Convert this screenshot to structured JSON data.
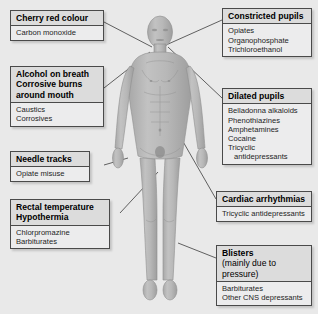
{
  "diagram": {
    "background_color": "#e9e9e9",
    "figure_label": "human-body-anterior-view"
  },
  "boxes": [
    {
      "id": "cherry-red-colour",
      "header": "Cherry red colour",
      "subheader": "",
      "items": [
        "Carbon monoxide"
      ],
      "side": "left"
    },
    {
      "id": "alcohol-on-breath",
      "header": "Alcohol on breath\nCorrosive burns\naround mouth",
      "subheader": "",
      "items": [
        "Caustics",
        "Corrosives"
      ],
      "side": "left"
    },
    {
      "id": "needle-tracks",
      "header": "Needle tracks",
      "subheader": "",
      "items": [
        "Opiate misuse"
      ],
      "side": "left"
    },
    {
      "id": "rectal-temperature",
      "header": "Rectal temperature\nHypothermia",
      "subheader": "",
      "items": [
        "Chlorpromazine",
        "Barbiturates"
      ],
      "side": "left"
    },
    {
      "id": "constricted-pupils",
      "header": "Constricted pupils",
      "subheader": "",
      "items": [
        "Opiates",
        "Organophosphate",
        "Trichloroethanol"
      ],
      "side": "right"
    },
    {
      "id": "dilated-pupils",
      "header": "Dilated pupils",
      "subheader": "",
      "items": [
        "Belladonna alkaloids",
        "Phenothiazines",
        "Amphetamines",
        "Cocaine",
        "Tricyclic",
        "antidepressants"
      ],
      "side": "right"
    },
    {
      "id": "cardiac-arrhythmias",
      "header": "Cardiac arrhythmias",
      "subheader": "",
      "items": [
        "Tricyclic antidepressants"
      ],
      "side": "right"
    },
    {
      "id": "blisters",
      "header": "Blisters",
      "subheader": "(mainly due to pressure)",
      "items": [
        "Barbiturates",
        "Other CNS depressants"
      ],
      "side": "right"
    }
  ],
  "line_color": "#3c3c3c"
}
